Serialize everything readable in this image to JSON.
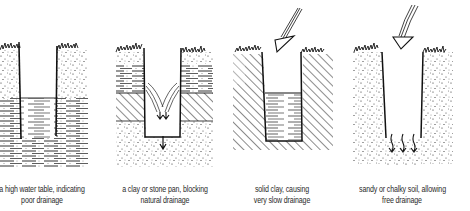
{
  "figure": {
    "type": "soil drainage illustration",
    "panels": [
      {
        "id": "high-water-table",
        "caption_line1": "a high water table, indicating",
        "caption_line2": "poor drainage",
        "center_x": 42
      },
      {
        "id": "clay-stone-pan",
        "caption_line1": "a clay or stone pan, blocking",
        "caption_line2": "natural drainage",
        "center_x": 165
      },
      {
        "id": "solid-clay",
        "caption_line1": "solid clay, causing",
        "caption_line2": "very slow drainage",
        "center_x": 282
      },
      {
        "id": "sandy-chalky-soil",
        "caption_line1": "sandy or chalky soil, allowing",
        "caption_line2": "free drainage",
        "center_x": 402
      }
    ]
  },
  "colors": {
    "ink": "#1a1a1a",
    "background": "#ffffff",
    "caption": "#2a2a2a"
  }
}
